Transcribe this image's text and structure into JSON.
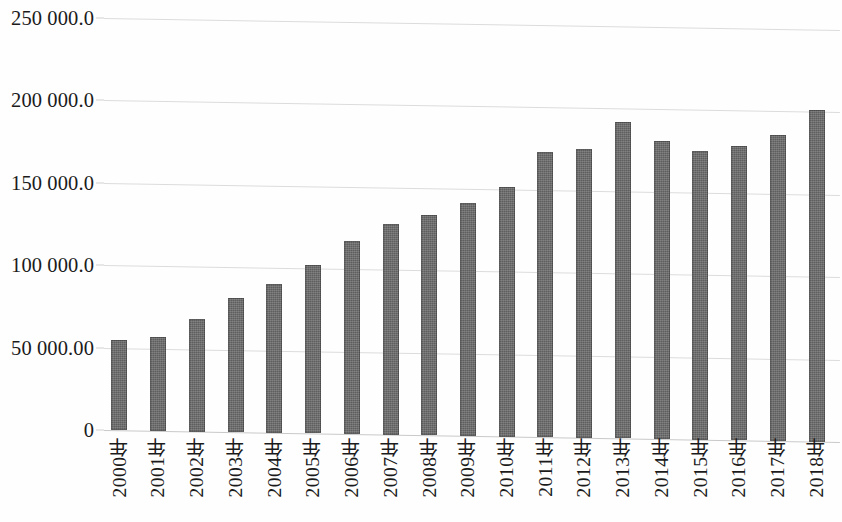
{
  "chart_data": {
    "type": "bar",
    "title": "",
    "subtitle": "",
    "xlabel": "",
    "ylabel": "",
    "legend": [],
    "grid": true,
    "legend_position": "none",
    "ylim": [
      0,
      250000
    ],
    "y_ticks": [
      0,
      50000,
      100000,
      150000,
      200000,
      250000
    ],
    "y_tick_labels": [
      "0",
      "50 000.00",
      "100 000.0",
      "150 000.0",
      "200 000.0",
      "250 000.0"
    ],
    "categories": [
      "2000年",
      "2001年",
      "2002年",
      "2003年",
      "2004年",
      "2005年",
      "2006年",
      "2007年",
      "2008年",
      "2009年",
      "2010年",
      "2011年",
      "2012年",
      "2013年",
      "2014年",
      "2015年",
      "2016年",
      "2017年",
      "2018年"
    ],
    "values": [
      55000,
      57000,
      68000,
      81500,
      90500,
      102000,
      117000,
      128000,
      133500,
      141500,
      151500,
      173000,
      175500,
      192000,
      181000,
      175500,
      178500,
      185500,
      201500
    ],
    "bar_color": "#5e5e5e",
    "gridline_color": "#dcdcdc",
    "background_color": "#fefefe",
    "text_color": "#1b1b1b"
  }
}
